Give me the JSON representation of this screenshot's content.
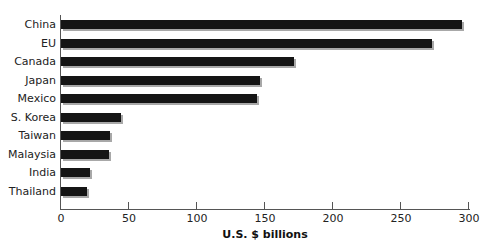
{
  "chart_data": {
    "type": "bar",
    "orientation": "horizontal",
    "title": "",
    "xlabel": "U.S. $ billions",
    "ylabel": "",
    "categories": [
      "China",
      "EU",
      "Canada",
      "Japan",
      "Mexico",
      "S. Korea",
      "Taiwan",
      "Malaysia",
      "India",
      "Thailand"
    ],
    "values": [
      295,
      273,
      171,
      146,
      144,
      44,
      36,
      35,
      21,
      19
    ],
    "xlim": [
      0,
      300
    ],
    "x_ticks": [
      "0",
      "50",
      "100",
      "150",
      "200",
      "250",
      "300"
    ],
    "grid": false,
    "legend": null,
    "bar_color": "#151515",
    "shadow_color": "#a8a8a8"
  }
}
